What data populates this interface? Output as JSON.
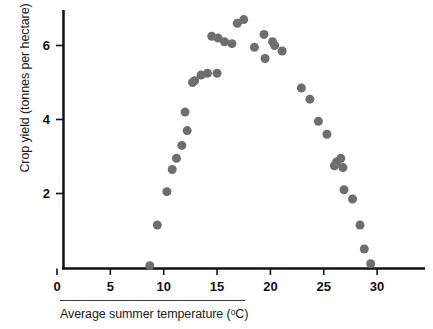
{
  "chart_data": {
    "type": "scatter",
    "title": "",
    "xlabel": "Average summer temperature (°C)",
    "ylabel": "Crop yield (tonnes per hectare)",
    "xlim": [
      0,
      33
    ],
    "ylim": [
      0,
      6.9
    ],
    "xticks": [
      0,
      5,
      10,
      15,
      20,
      25,
      30
    ],
    "xtick_labels": [
      "0",
      "5",
      "10",
      "15",
      "20",
      "25",
      "30"
    ],
    "yticks": [
      2,
      4,
      6
    ],
    "ytick_labels": [
      "2",
      "4",
      "6"
    ],
    "grid": false,
    "legend": null,
    "marker": {
      "shape": "circle",
      "color": "#6e6e6e",
      "size": 9
    },
    "series": [
      {
        "name": "Crop yield",
        "points": [
          [
            8.7,
            0.05
          ],
          [
            9.4,
            1.15
          ],
          [
            10.3,
            2.05
          ],
          [
            10.8,
            2.65
          ],
          [
            11.2,
            2.95
          ],
          [
            11.7,
            3.3
          ],
          [
            12.2,
            3.7
          ],
          [
            12.0,
            4.2
          ],
          [
            12.7,
            5.0
          ],
          [
            12.9,
            5.05
          ],
          [
            13.5,
            5.2
          ],
          [
            14.1,
            5.25
          ],
          [
            15.0,
            5.25
          ],
          [
            14.5,
            6.25
          ],
          [
            15.1,
            6.2
          ],
          [
            15.7,
            6.1
          ],
          [
            16.4,
            6.05
          ],
          [
            16.9,
            6.6
          ],
          [
            17.5,
            6.7
          ],
          [
            18.5,
            5.95
          ],
          [
            19.4,
            6.3
          ],
          [
            19.5,
            5.65
          ],
          [
            20.2,
            6.1
          ],
          [
            20.4,
            6.0
          ],
          [
            21.1,
            5.85
          ],
          [
            22.9,
            4.85
          ],
          [
            23.7,
            4.55
          ],
          [
            24.5,
            3.95
          ],
          [
            25.3,
            3.6
          ],
          [
            26.2,
            2.85
          ],
          [
            26.0,
            2.75
          ],
          [
            26.6,
            2.95
          ],
          [
            26.8,
            2.7
          ],
          [
            26.9,
            2.1
          ],
          [
            27.7,
            1.85
          ],
          [
            28.4,
            1.15
          ],
          [
            28.8,
            0.5
          ],
          [
            29.4,
            0.1
          ]
        ]
      }
    ]
  },
  "axes": {
    "x_title": "Average summer temperature (",
    "x_title_unit": "o",
    "x_title_tail": "C)",
    "y_title": "Crop yield (tonnes per hectare)"
  },
  "colors": {
    "marker": "#6e6e6e",
    "axis": "#111111",
    "text": "#1a1a1a"
  }
}
